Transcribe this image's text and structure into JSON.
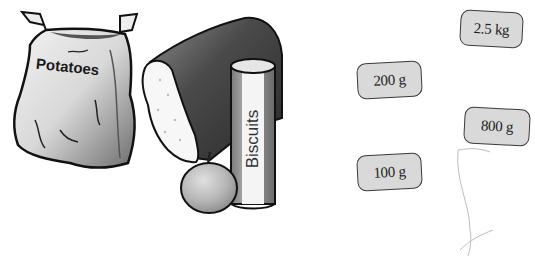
{
  "items": [
    {
      "name": "potatoes",
      "label": "Potatoes"
    },
    {
      "name": "bread",
      "label": ""
    },
    {
      "name": "biscuits",
      "label": "Biscuits"
    },
    {
      "name": "apple",
      "label": ""
    }
  ],
  "weights": [
    {
      "label": "2.5 kg"
    },
    {
      "label": "200 g"
    },
    {
      "label": "800 g"
    },
    {
      "label": "100 g"
    }
  ],
  "colors": {
    "card_fill": "#d9d9d9",
    "card_border": "#3a3a3a",
    "bread_crust": "#3d3d3d",
    "outline": "#111111"
  }
}
